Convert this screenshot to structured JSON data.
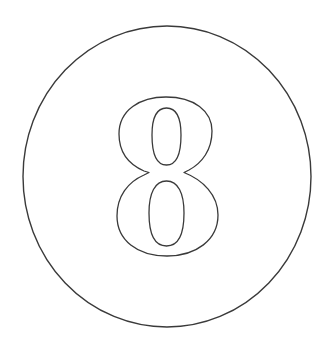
{
  "badge": {
    "label": "8",
    "shape": "circle",
    "style": "outline",
    "colors": {
      "background": "#ffffff",
      "stroke": "#3a3a3a"
    }
  }
}
